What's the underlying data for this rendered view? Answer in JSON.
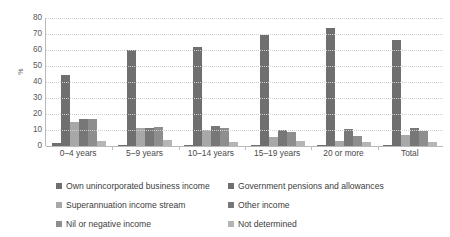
{
  "chart_data": {
    "type": "bar",
    "title": "",
    "xlabel": "",
    "ylabel": "%",
    "ylim": [
      0,
      80
    ],
    "yticks": [
      0,
      10,
      20,
      30,
      40,
      50,
      60,
      70,
      80
    ],
    "grid": true,
    "legend_position": "bottom",
    "categories": [
      "0–4 years",
      "5–9 years",
      "10–14 years",
      "15–19 years",
      "20 or more",
      "Total"
    ],
    "series": [
      {
        "name": "Own unincorporated business income",
        "color": "#6f6f6f",
        "values": [
          2.0,
          0.8,
          0.8,
          0.6,
          0.6,
          0.7
        ]
      },
      {
        "name": "Government pensions and allowances",
        "color": "#6f6f6f",
        "values": [
          44.5,
          60.0,
          62.0,
          69.5,
          74.0,
          66.0
        ]
      },
      {
        "name": "Superannuation income stream",
        "color": "#a8a8a8",
        "values": [
          15.0,
          11.5,
          10.0,
          5.5,
          3.0,
          7.0
        ]
      },
      {
        "name": "Other income",
        "color": "#777777",
        "values": [
          17.0,
          11.0,
          12.5,
          10.0,
          10.5,
          11.5
        ]
      },
      {
        "name": "Nil or negative income",
        "color": "#8e8e8e",
        "values": [
          17.0,
          12.0,
          11.0,
          9.0,
          6.0,
          9.5
        ]
      },
      {
        "name": "Not determined",
        "color": "#b5b5b5",
        "values": [
          3.0,
          3.5,
          2.5,
          3.0,
          2.5,
          2.5
        ]
      }
    ]
  },
  "axis": {
    "y_label": "%",
    "tick_labels": [
      "80",
      "70",
      "60",
      "50",
      "40",
      "30",
      "20",
      "10",
      "0"
    ]
  },
  "legend": {
    "items": [
      {
        "label": "Own unincorporated business income",
        "color": "#6f6f6f"
      },
      {
        "label": "Government pensions and allowances",
        "color": "#6f6f6f"
      },
      {
        "label": "Superannuation income stream",
        "color": "#a8a8a8"
      },
      {
        "label": "Other income",
        "color": "#777777"
      },
      {
        "label": "Nil or negative income",
        "color": "#8e8e8e"
      },
      {
        "label": "Not determined",
        "color": "#b5b5b5"
      }
    ]
  }
}
